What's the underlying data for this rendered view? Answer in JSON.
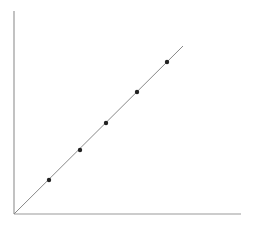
{
  "chart_data": {
    "type": "scatter",
    "title": "",
    "xlabel": "",
    "ylabel": "",
    "x": [
      1,
      2,
      3,
      4,
      5
    ],
    "series": [
      {
        "name": "points",
        "values": [
          1,
          2,
          3,
          4,
          5
        ]
      }
    ],
    "fit_line": {
      "type": "linear",
      "slope": 1,
      "intercept": 0,
      "from_origin": true
    },
    "grid": false,
    "legend": "none",
    "tick_labels": "none"
  },
  "layout": {
    "origin": [
      14,
      214
    ],
    "x_axis_end": [
      241,
      214
    ],
    "y_axis_top": [
      14,
      11
    ],
    "line_end": [
      183,
      46
    ],
    "points_px": [
      [
        49,
        180
      ],
      [
        80,
        150
      ],
      [
        106,
        123
      ],
      [
        137,
        92
      ],
      [
        167,
        62
      ]
    ],
    "axis_color": "#999999",
    "line_color": "#888888",
    "point_color": "#222222"
  }
}
